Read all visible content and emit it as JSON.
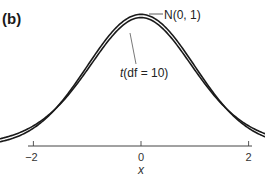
{
  "panel_label": "(b)",
  "chart_data": {
    "type": "line",
    "title": "",
    "xlabel": "x",
    "ylabel": "",
    "xlim": [
      -4,
      4
    ],
    "x_ticks": [
      -4,
      -2,
      0,
      2,
      4
    ],
    "x_tick_labels": [
      "−4",
      "−2",
      "0",
      "2",
      "4"
    ],
    "grid": false,
    "legend": "none (curves labeled by annotations)",
    "series": [
      {
        "name": "N(0, 1)",
        "distribution": "standard normal",
        "peak_density": 0.399,
        "x": [
          -4,
          -3.5,
          -3,
          -2.5,
          -2,
          -1.5,
          -1,
          -0.5,
          0,
          0.5,
          1,
          1.5,
          2,
          2.5,
          3,
          3.5,
          4
        ],
        "values": [
          0.0001,
          0.0009,
          0.0044,
          0.0175,
          0.054,
          0.1295,
          0.242,
          0.3521,
          0.3989,
          0.3521,
          0.242,
          0.1295,
          0.054,
          0.0175,
          0.0044,
          0.0009,
          0.0001
        ]
      },
      {
        "name": "t(df = 10)",
        "distribution": "Student t, 10 degrees of freedom",
        "peak_density": 0.389,
        "x": [
          -4,
          -3.5,
          -3,
          -2.5,
          -2,
          -1.5,
          -1,
          -0.5,
          0,
          0.5,
          1,
          1.5,
          2,
          2.5,
          3,
          3.5,
          4
        ],
        "values": [
          0.002,
          0.0046,
          0.0114,
          0.0269,
          0.0611,
          0.1274,
          0.2304,
          0.3397,
          0.3891,
          0.3397,
          0.2304,
          0.1274,
          0.0611,
          0.0269,
          0.0114,
          0.0046,
          0.002
        ]
      }
    ],
    "annotations": [
      {
        "text": "N(0, 1)",
        "points_to": "peak of normal curve"
      },
      {
        "text": "t(df = 10)",
        "points_to": "left shoulder of t curve"
      }
    ]
  },
  "annotations": {
    "normal": "N(0, 1)",
    "t_prefix": "t",
    "t_suffix": "(df = 10)"
  },
  "axis": {
    "x_label": "x",
    "ticks": [
      "−4",
      "−2",
      "0",
      "2",
      "4"
    ]
  }
}
